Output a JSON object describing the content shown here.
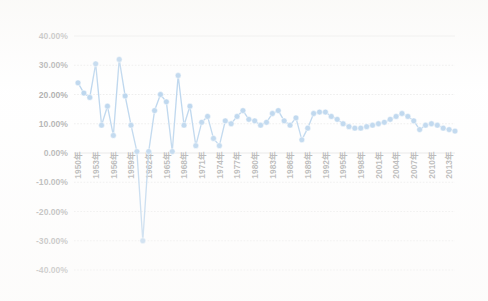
{
  "chart_data": {
    "type": "line",
    "title": "",
    "subtitle": "",
    "xlabel": "",
    "ylabel": "",
    "ylim": [
      -40,
      40
    ],
    "ytick_labels": [
      "40.00%",
      "30.00%",
      "20.00%",
      "10.00%",
      "0.00%",
      "-10.00%",
      "-20.00%",
      "-30.00%",
      "-40.00%"
    ],
    "ytick_values": [
      40,
      30,
      20,
      10,
      0,
      -10,
      -20,
      -30,
      -40
    ],
    "grid": true,
    "legend": "none",
    "series_color": "#5B9BD5",
    "marker": "circle",
    "xtick_labels": [
      "1950年",
      "1953年",
      "1956年",
      "1959年",
      "1962年",
      "1965年",
      "1968年",
      "1971年",
      "1974年",
      "1977年",
      "1980年",
      "1983年",
      "1986年",
      "1989年",
      "1992年",
      "1995年",
      "1998年",
      "2001年",
      "2004年",
      "2007年",
      "2010年",
      "2013年"
    ],
    "xtick_values": [
      1950,
      1953,
      1956,
      1959,
      1962,
      1965,
      1968,
      1971,
      1974,
      1977,
      1980,
      1983,
      1986,
      1989,
      1992,
      1995,
      1998,
      2001,
      2004,
      2007,
      2010,
      2013
    ],
    "x": [
      1950,
      1951,
      1952,
      1953,
      1954,
      1955,
      1956,
      1957,
      1958,
      1959,
      1960,
      1961,
      1962,
      1963,
      1964,
      1965,
      1966,
      1967,
      1968,
      1969,
      1970,
      1971,
      1972,
      1973,
      1974,
      1975,
      1976,
      1977,
      1978,
      1979,
      1980,
      1981,
      1982,
      1983,
      1984,
      1985,
      1986,
      1987,
      1988,
      1989,
      1990,
      1991,
      1992,
      1993,
      1994,
      1995,
      1996,
      1997,
      1998,
      1999,
      2000,
      2001,
      2002,
      2003,
      2004,
      2005,
      2006,
      2007,
      2008,
      2009,
      2010,
      2011,
      2012,
      2013,
      2014
    ],
    "values": [
      24.0,
      20.5,
      19.0,
      30.5,
      9.5,
      16.0,
      6.0,
      32.0,
      19.5,
      9.5,
      0.5,
      -30.0,
      0.5,
      14.5,
      20.0,
      17.5,
      0.5,
      26.5,
      9.5,
      16.0,
      2.5,
      10.5,
      12.5,
      5.0,
      2.5,
      11.0,
      10.0,
      12.5,
      14.5,
      11.5,
      11.0,
      9.5,
      10.5,
      13.5,
      14.5,
      11.0,
      9.5,
      12.0,
      4.5,
      8.5,
      13.5,
      14.0,
      14.0,
      12.5,
      11.5,
      10.0,
      9.0,
      8.5,
      8.5,
      9.0,
      9.5,
      10.0,
      10.5,
      11.5,
      12.5,
      13.5,
      12.5,
      11.0,
      8.0,
      9.5,
      10.0,
      9.5,
      8.5,
      8.0,
      7.5
    ]
  },
  "axis": {
    "y_title": "",
    "x_title": ""
  }
}
